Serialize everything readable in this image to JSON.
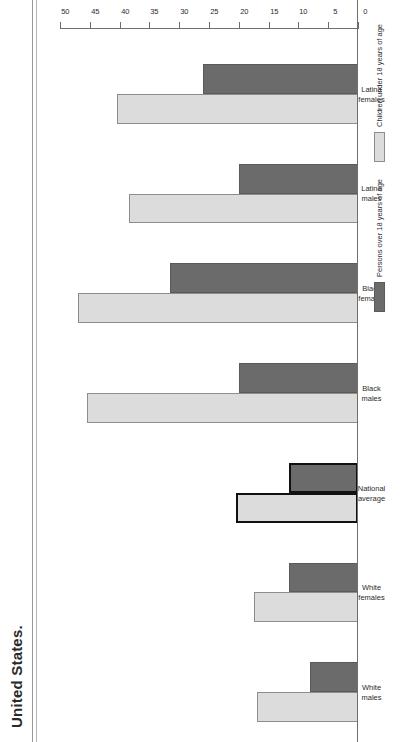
{
  "figure": {
    "caption_fragment": "United States.",
    "orientation": "page rotated 90 degrees counter-clockwise"
  },
  "legend": {
    "position": "bottom-right",
    "items": [
      {
        "label": "Persons over 18 years of age",
        "swatch": "dark",
        "color": "#6b6b6b"
      },
      {
        "label": "Children under 18 years of age",
        "swatch": "light",
        "color": "#dcdcdc"
      }
    ]
  },
  "axis": {
    "ticks": [
      "50",
      "45",
      "40",
      "35",
      "30",
      "25",
      "20",
      "15",
      "10",
      "5",
      "0"
    ],
    "min": 0,
    "max": 50,
    "step": 5
  },
  "categories": [
    {
      "line1": "White",
      "line2": "males"
    },
    {
      "line1": "White",
      "line2": "females"
    },
    {
      "line1": "National",
      "line2": "average"
    },
    {
      "line1": "Black",
      "line2": "males"
    },
    {
      "line1": "Black",
      "line2": "females"
    },
    {
      "line1": "Latino",
      "line2": "males"
    },
    {
      "line1": "Latina",
      "line2": "females"
    }
  ],
  "chart_data": {
    "type": "bar",
    "title": "United States.",
    "xlabel": "",
    "ylabel": "",
    "ylim": [
      0,
      50
    ],
    "grid": false,
    "legend_position": "bottom-right",
    "highlight_category": "National average",
    "categories": [
      "White males",
      "White females",
      "National average",
      "Black males",
      "Black females",
      "Latino males",
      "Latina females"
    ],
    "series": [
      {
        "name": "Persons over 18 years of age",
        "color": "#6b6b6b",
        "values": [
          8,
          11.5,
          11.5,
          20,
          31.5,
          20,
          26
        ]
      },
      {
        "name": "Children under 18 years of age",
        "color": "#dcdcdc",
        "values": [
          17,
          17.5,
          20.5,
          45.5,
          47,
          38.5,
          40.5
        ]
      }
    ]
  }
}
